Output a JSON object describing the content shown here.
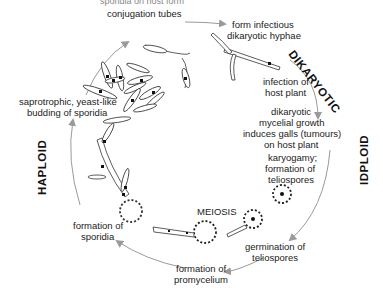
{
  "diagram": {
    "type": "life-cycle",
    "phases": {
      "dikaryotic": "DIKARYOTIC",
      "diploid": "IDPLOID",
      "haploid": "HAPLOID"
    },
    "stages": {
      "top_cut": "sporidia on host form",
      "conjugation": "conjugation tubes",
      "form_hyphae_1": "form infectious",
      "form_hyphae_2": "dikaryotic hyphae",
      "infection_1": "infection of",
      "infection_2": "host plant",
      "growth_1": "dikaryotic",
      "growth_2": "mycelial growth",
      "growth_3": "induces galls (tumours)",
      "growth_4": "on host plant",
      "karyogamy_1": "karyogamy;",
      "karyogamy_2": "formation of",
      "karyogamy_3": "teliospores",
      "meiosis": "MEIOSIS",
      "germination_1": "germination of",
      "germination_2": "teliospores",
      "promycelium_1": "formation of",
      "promycelium_2": "promycelium",
      "sporidia_1": "formation of",
      "sporidia_2": "sporidia",
      "budding_1": "saprotrophic, yeast-like",
      "budding_2": "budding of sporidia"
    },
    "colors": {
      "arrow": "#9a9a9a",
      "line": "#222222",
      "text": "#222222"
    }
  }
}
